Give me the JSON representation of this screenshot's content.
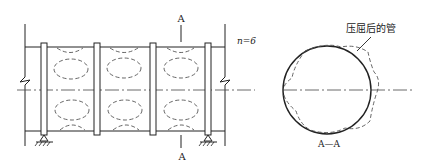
{
  "diagram": {
    "type": "engineering-drawing",
    "colors": {
      "line": "#222222",
      "dashed": "#555555",
      "background": "#ffffff"
    },
    "elevation_view": {
      "section_mark_top": "A",
      "section_mark_bottom": "A",
      "mode_label": "n=6",
      "stiffener_rings": 4,
      "supports": 2
    },
    "section_view": {
      "title": "A—A",
      "callout": "压屈后的管",
      "buckled_lobes": 6
    }
  }
}
